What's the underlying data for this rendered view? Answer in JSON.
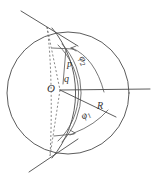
{
  "figure": {
    "caption": "",
    "background_color": "#ffffff",
    "stroke_color": "#4a4a4a",
    "labels": {
      "center": "O",
      "charge": "q",
      "point": "p",
      "radius": "R",
      "angle_upper": "φ",
      "angle_upper_sub": "2",
      "angle_lower": "φ",
      "angle_lower_sub": "1"
    }
  },
  "geometry": {
    "type": "sphere-with-spherical-cap",
    "outer_circle": {
      "cx": 68,
      "cy": 93,
      "r": 62
    },
    "cap_sphere": {
      "cx": 48,
      "cy": 93,
      "r": 100
    },
    "center_point": {
      "x": 60,
      "y": 90
    },
    "radius_line": {
      "from": [
        60,
        90
      ],
      "to": [
        148,
        89
      ]
    },
    "radius_segment_phi1": {
      "from": [
        60,
        90
      ],
      "to": [
        113,
        116
      ]
    },
    "secant_line_top": {
      "from": [
        22,
        11
      ],
      "to": [
        75,
        44
      ]
    },
    "secant_line_bottom": {
      "from": [
        30,
        172
      ],
      "to": [
        75,
        142
      ]
    },
    "dashed_chord": {
      "from": [
        48,
        27
      ],
      "to": [
        50,
        155
      ]
    },
    "angle_arc_upper_deg": [
      0,
      62
    ],
    "angle_arc_lower_deg": [
      0,
      -32
    ]
  }
}
